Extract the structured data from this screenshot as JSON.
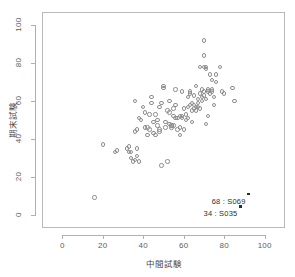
{
  "chart_data": {
    "type": "scatter",
    "title": "",
    "xlabel": "中間試験",
    "ylabel": "期末試験",
    "xlim": [
      -10,
      110
    ],
    "ylim": [
      -7,
      107
    ],
    "xticks": [
      0,
      20,
      40,
      60,
      80,
      100
    ],
    "yticks": [
      0,
      20,
      40,
      60,
      80,
      100
    ],
    "grid": false,
    "legend": null,
    "marker": "open-circle",
    "marker_color": "#8e8e8e",
    "points": [
      {
        "x": 16,
        "y": 9
      },
      {
        "x": 20,
        "y": 37
      },
      {
        "x": 26,
        "y": 33
      },
      {
        "x": 27,
        "y": 34
      },
      {
        "x": 32,
        "y": 35
      },
      {
        "x": 33,
        "y": 36
      },
      {
        "x": 33,
        "y": 33
      },
      {
        "x": 34,
        "y": 33
      },
      {
        "x": 34,
        "y": 30
      },
      {
        "x": 35,
        "y": 28
      },
      {
        "x": 36,
        "y": 29
      },
      {
        "x": 37,
        "y": 35
      },
      {
        "x": 37,
        "y": 31
      },
      {
        "x": 38,
        "y": 28
      },
      {
        "x": 37,
        "y": 45
      },
      {
        "x": 36,
        "y": 44
      },
      {
        "x": 38,
        "y": 51
      },
      {
        "x": 39,
        "y": 50
      },
      {
        "x": 36,
        "y": 60
      },
      {
        "x": 40,
        "y": 57
      },
      {
        "x": 41,
        "y": 46
      },
      {
        "x": 42,
        "y": 46
      },
      {
        "x": 43,
        "y": 45
      },
      {
        "x": 42,
        "y": 42
      },
      {
        "x": 41,
        "y": 54
      },
      {
        "x": 43,
        "y": 53
      },
      {
        "x": 44,
        "y": 62
      },
      {
        "x": 44,
        "y": 59
      },
      {
        "x": 45,
        "y": 49
      },
      {
        "x": 45,
        "y": 43
      },
      {
        "x": 46,
        "y": 42
      },
      {
        "x": 47,
        "y": 50
      },
      {
        "x": 47,
        "y": 47
      },
      {
        "x": 48,
        "y": 45
      },
      {
        "x": 48,
        "y": 44
      },
      {
        "x": 49,
        "y": 59
      },
      {
        "x": 49,
        "y": 26
      },
      {
        "x": 50,
        "y": 67
      },
      {
        "x": 50,
        "y": 68
      },
      {
        "x": 51,
        "y": 49
      },
      {
        "x": 51,
        "y": 46
      },
      {
        "x": 52,
        "y": 28
      },
      {
        "x": 52,
        "y": 55
      },
      {
        "x": 53,
        "y": 60
      },
      {
        "x": 53,
        "y": 54
      },
      {
        "x": 53,
        "y": 48
      },
      {
        "x": 54,
        "y": 47
      },
      {
        "x": 54,
        "y": 47
      },
      {
        "x": 54,
        "y": 46
      },
      {
        "x": 55,
        "y": 47
      },
      {
        "x": 55,
        "y": 56
      },
      {
        "x": 55,
        "y": 52
      },
      {
        "x": 56,
        "y": 66
      },
      {
        "x": 56,
        "y": 58
      },
      {
        "x": 56,
        "y": 51
      },
      {
        "x": 57,
        "y": 51
      },
      {
        "x": 57,
        "y": 45
      },
      {
        "x": 58,
        "y": 42
      },
      {
        "x": 58,
        "y": 46
      },
      {
        "x": 58,
        "y": 52
      },
      {
        "x": 59,
        "y": 52
      },
      {
        "x": 59,
        "y": 51
      },
      {
        "x": 60,
        "y": 45
      },
      {
        "x": 60,
        "y": 56
      },
      {
        "x": 61,
        "y": 53
      },
      {
        "x": 61,
        "y": 50
      },
      {
        "x": 62,
        "y": 57
      },
      {
        "x": 62,
        "y": 62
      },
      {
        "x": 63,
        "y": 65
      },
      {
        "x": 63,
        "y": 64
      },
      {
        "x": 63,
        "y": 58
      },
      {
        "x": 64,
        "y": 55
      },
      {
        "x": 64,
        "y": 49
      },
      {
        "x": 64,
        "y": 59
      },
      {
        "x": 65,
        "y": 63
      },
      {
        "x": 65,
        "y": 58
      },
      {
        "x": 65,
        "y": 56
      },
      {
        "x": 66,
        "y": 57
      },
      {
        "x": 66,
        "y": 55
      },
      {
        "x": 66,
        "y": 68
      },
      {
        "x": 67,
        "y": 61
      },
      {
        "x": 67,
        "y": 59
      },
      {
        "x": 67,
        "y": 57
      },
      {
        "x": 68,
        "y": 56
      },
      {
        "x": 68,
        "y": 64
      },
      {
        "x": 68,
        "y": 78
      },
      {
        "x": 69,
        "y": 62
      },
      {
        "x": 69,
        "y": 60
      },
      {
        "x": 69,
        "y": 66
      },
      {
        "x": 70,
        "y": 65
      },
      {
        "x": 70,
        "y": 63
      },
      {
        "x": 70,
        "y": 78
      },
      {
        "x": 70,
        "y": 92
      },
      {
        "x": 70,
        "y": 84
      },
      {
        "x": 71,
        "y": 77
      },
      {
        "x": 71,
        "y": 78
      },
      {
        "x": 71,
        "y": 61
      },
      {
        "x": 71,
        "y": 48
      },
      {
        "x": 72,
        "y": 52
      },
      {
        "x": 72,
        "y": 66
      },
      {
        "x": 72,
        "y": 65
      },
      {
        "x": 73,
        "y": 64
      },
      {
        "x": 73,
        "y": 74
      },
      {
        "x": 74,
        "y": 66
      },
      {
        "x": 74,
        "y": 65
      },
      {
        "x": 74,
        "y": 71
      },
      {
        "x": 75,
        "y": 62
      },
      {
        "x": 75,
        "y": 58
      },
      {
        "x": 76,
        "y": 74
      },
      {
        "x": 76,
        "y": 70
      },
      {
        "x": 78,
        "y": 78
      },
      {
        "x": 79,
        "y": 65
      },
      {
        "x": 80,
        "y": 64
      },
      {
        "x": 84,
        "y": 67
      },
      {
        "x": 85,
        "y": 60
      },
      {
        "x": 59,
        "y": 65
      },
      {
        "x": 62,
        "y": 51
      },
      {
        "x": 48,
        "y": 57
      },
      {
        "x": 46,
        "y": 53
      }
    ],
    "highlighted_points": [
      {
        "x": 92,
        "y": 11,
        "label": "68 : S069"
      },
      {
        "x": 88,
        "y": 4.5,
        "label": "34 : S035"
      }
    ]
  }
}
